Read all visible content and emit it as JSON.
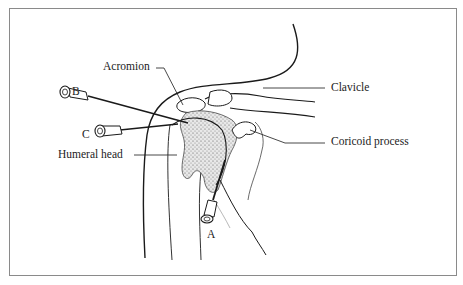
{
  "figure": {
    "labels": {
      "acromion": "Acromion",
      "clavicle": "Clavicle",
      "coracoid": "Coricoid process",
      "humeral_head": "Humeral head"
    },
    "needles": {
      "a": "A",
      "b": "B",
      "c": "C"
    },
    "colors": {
      "ink": "#1a1a1a",
      "frame": "#8a8a8a",
      "stipple": "#bdbdbd",
      "background": "#ffffff"
    }
  }
}
